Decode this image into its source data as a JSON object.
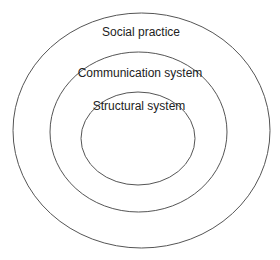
{
  "diagram": {
    "type": "nested-circles",
    "layers": [
      {
        "id": "outer",
        "label": "Social practice"
      },
      {
        "id": "middle",
        "label": "Communication system"
      },
      {
        "id": "inner",
        "label": "Structural system"
      }
    ],
    "colors": {
      "stroke": "#555555",
      "text": "#222222",
      "background": "#ffffff"
    }
  }
}
